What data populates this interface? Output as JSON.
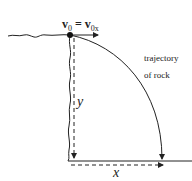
{
  "diagram": {
    "velocity_label": {
      "v": "v",
      "sub0": "0",
      "eq": " = ",
      "v2": "v",
      "sub0x": "0x"
    },
    "trajectory_label_line1": "trajectory",
    "trajectory_label_line2": "of rock",
    "y_label": "y",
    "x_label": "x",
    "colors": {
      "line": "#222222",
      "background": "#ffffff"
    }
  }
}
